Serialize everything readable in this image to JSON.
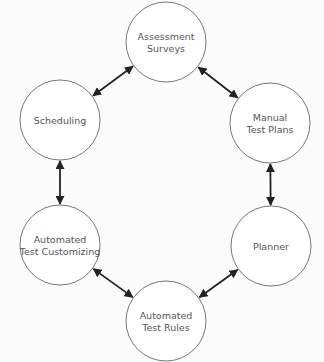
{
  "diagram": {
    "nodes": [
      {
        "id": "assessment",
        "lines": [
          "Assessment",
          "Surveys"
        ],
        "cx": 166,
        "cy": 42,
        "r": 40
      },
      {
        "id": "manual",
        "lines": [
          "Manual",
          "Test Plans"
        ],
        "cx": 270,
        "cy": 123,
        "r": 40
      },
      {
        "id": "planner",
        "lines": [
          "Planner"
        ],
        "cx": 271,
        "cy": 246,
        "r": 40
      },
      {
        "id": "rules",
        "lines": [
          "Automated",
          "Test Rules"
        ],
        "cx": 166,
        "cy": 321,
        "r": 40
      },
      {
        "id": "customizing",
        "lines": [
          "Automated",
          "Test Customizing"
        ],
        "cx": 60,
        "cy": 245,
        "r": 40
      },
      {
        "id": "scheduling",
        "lines": [
          "Scheduling"
        ],
        "cx": 60,
        "cy": 120,
        "r": 40
      }
    ],
    "edges": [
      {
        "from": "assessment",
        "to": "manual",
        "bidirectional": true
      },
      {
        "from": "manual",
        "to": "planner",
        "bidirectional": true
      },
      {
        "from": "planner",
        "to": "rules",
        "bidirectional": true
      },
      {
        "from": "rules",
        "to": "customizing",
        "bidirectional": true
      },
      {
        "from": "customizing",
        "to": "scheduling",
        "bidirectional": true
      },
      {
        "from": "scheduling",
        "to": "assessment",
        "bidirectional": true
      }
    ],
    "colors": {
      "stroke": "#555555",
      "arrow": "#222222",
      "text": "#555555",
      "fill": "#ffffff"
    }
  }
}
